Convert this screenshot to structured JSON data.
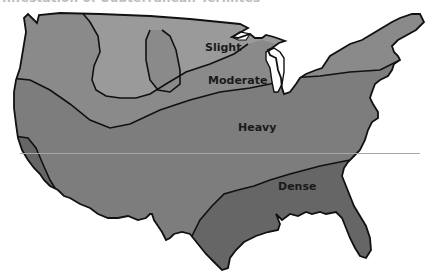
{
  "title": "Infestation of Subterranean Termites",
  "map": {
    "region": "Continental United States",
    "zones": [
      {
        "name": "slight",
        "label": "Slight",
        "color": "#9a9a9a",
        "label_pos": [
          205,
          48
        ]
      },
      {
        "name": "moderate",
        "label": "Moderate",
        "color": "#8a8a8a",
        "label_pos": [
          208,
          81
        ]
      },
      {
        "name": "heavy",
        "label": "Heavy",
        "color": "#7d7d7d",
        "label_pos": [
          238,
          128
        ]
      },
      {
        "name": "dense",
        "label": "Dense",
        "color": "#666666",
        "label_pos": [
          278,
          187
        ]
      }
    ],
    "border_color": "#111111"
  }
}
